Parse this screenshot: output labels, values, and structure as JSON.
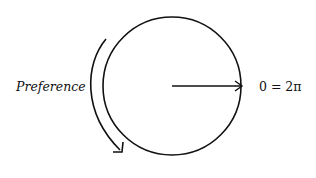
{
  "diagram": {
    "type": "circular-direction-diagram",
    "labels": {
      "preference": "Preference",
      "zero_angle": "0 = 2π"
    },
    "elements": {
      "circle": {
        "cx": 172,
        "cy": 86,
        "r": 69
      },
      "radius_arrow": {
        "from": [
          172,
          86
        ],
        "to": [
          243,
          86
        ],
        "direction": "right"
      },
      "curved_arrow": {
        "side": "left",
        "direction": "counter-clockwise-downward"
      }
    },
    "colors": {
      "stroke": "#111111",
      "background": "#ffffff"
    }
  }
}
